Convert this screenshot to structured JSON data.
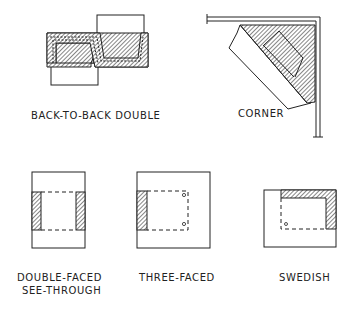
{
  "diagram": {
    "type": "fireplace-configurations-plan-views",
    "colors": {
      "line": "#222222",
      "background": "#ffffff"
    },
    "figures": [
      {
        "id": "back-to-back-double",
        "label": "BACK-TO-BACK DOUBLE"
      },
      {
        "id": "corner",
        "label": "CORNER"
      },
      {
        "id": "double-faced-see-through",
        "label_line1": "DOUBLE-FACED",
        "label_line2": "SEE-THROUGH"
      },
      {
        "id": "three-faced",
        "label": "THREE-FACED"
      },
      {
        "id": "swedish",
        "label": "SWEDISH"
      }
    ]
  }
}
